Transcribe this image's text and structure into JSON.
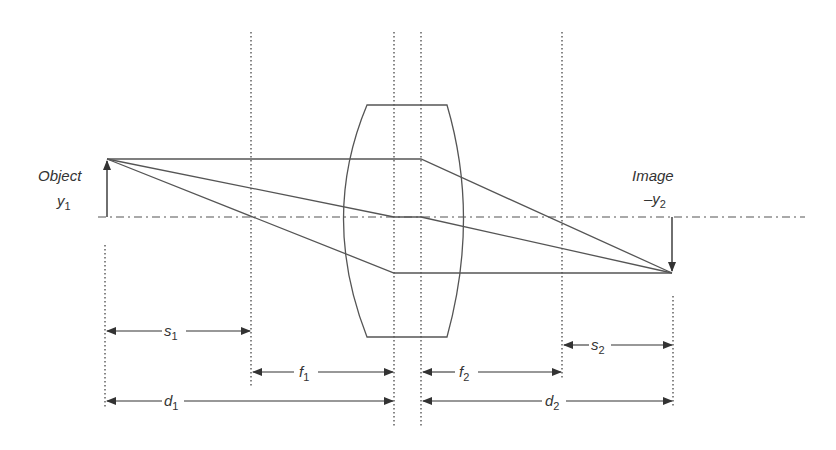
{
  "diagram": {
    "type": "thick-lens-imaging",
    "colors": {
      "line": "#4a4a4a",
      "text": "#333333",
      "background": "#ffffff"
    },
    "object": {
      "label": "Object",
      "height_label": "y",
      "height_sub": "1"
    },
    "image": {
      "label": "Image",
      "height_label": "–y",
      "height_sub": "2"
    },
    "dimensions": {
      "s1": {
        "letter": "s",
        "sub": "1"
      },
      "f1": {
        "letter": "f",
        "sub": "1"
      },
      "d1": {
        "letter": "d",
        "sub": "1"
      },
      "f2": {
        "letter": "f",
        "sub": "2"
      },
      "s2": {
        "letter": "s",
        "sub": "2"
      },
      "d2": {
        "letter": "d",
        "sub": "2"
      }
    },
    "geometry": {
      "axis_y": 217,
      "object_x": 107,
      "object_top_y": 159,
      "focal1_x": 251,
      "principal1_x": 394,
      "principal2_x": 421,
      "focal2_x": 562,
      "image_x": 672,
      "image_bottom_y": 273
    }
  }
}
